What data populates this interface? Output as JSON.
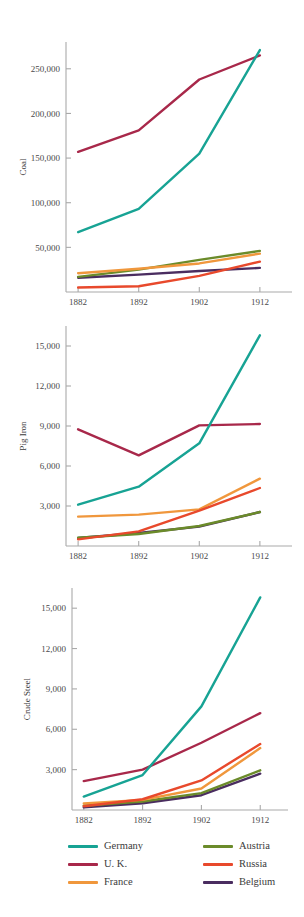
{
  "chart_data": [
    {
      "type": "line",
      "name": "coal-chart",
      "title": "",
      "ylabel": "Coal",
      "xlabel": "",
      "categories": [
        "1882",
        "1892",
        "1902",
        "1912"
      ],
      "x": [
        1882,
        1892,
        1902,
        1912
      ],
      "xlim": [
        1880,
        1914
      ],
      "ylim": [
        0,
        280000
      ],
      "yticks": [
        50000,
        100000,
        150000,
        200000,
        250000
      ],
      "ytick_labels": [
        "50,000",
        "100,000",
        "150,000",
        "200,000",
        "250,000"
      ],
      "grid": false,
      "series": [
        {
          "name": "Germany",
          "color": "#17a394",
          "values": [
            67000,
            93000,
            155000,
            271000
          ]
        },
        {
          "name": "U. K.",
          "color": "#a8284a",
          "values": [
            157000,
            181000,
            238000,
            265000
          ]
        },
        {
          "name": "France",
          "color": "#f0973c",
          "values": [
            21000,
            26000,
            32000,
            43000
          ]
        },
        {
          "name": "Austria",
          "color": "#6b8b2a",
          "values": [
            17000,
            25000,
            36000,
            46000
          ]
        },
        {
          "name": "Russia",
          "color": "#e8492c",
          "values": [
            5000,
            6500,
            18000,
            34000
          ]
        },
        {
          "name": "Belgium",
          "color": "#4a2d60",
          "values": [
            16000,
            19500,
            23500,
            27000
          ]
        }
      ]
    },
    {
      "type": "line",
      "name": "pig-iron-chart",
      "title": "",
      "ylabel": "Pig Iron",
      "xlabel": "",
      "categories": [
        "1882",
        "1892",
        "1902",
        "1912"
      ],
      "x": [
        1882,
        1892,
        1902,
        1912
      ],
      "xlim": [
        1880,
        1914
      ],
      "ylim": [
        0,
        16500
      ],
      "yticks": [
        3000,
        6000,
        9000,
        12000,
        15000
      ],
      "ytick_labels": [
        "3,000",
        "6,000",
        "9,000",
        "12,000",
        "15,000"
      ],
      "grid": false,
      "series": [
        {
          "name": "Germany",
          "color": "#17a394",
          "values": [
            3100,
            4450,
            7700,
            15800
          ]
        },
        {
          "name": "U. K.",
          "color": "#a8284a",
          "values": [
            8750,
            6800,
            9050,
            9150
          ]
        },
        {
          "name": "France",
          "color": "#f0973c",
          "values": [
            2200,
            2350,
            2750,
            5050
          ]
        },
        {
          "name": "Austria",
          "color": "#6b8b2a",
          "values": [
            620,
            900,
            1500,
            2550
          ]
        },
        {
          "name": "Russia",
          "color": "#e8492c",
          "values": [
            500,
            1100,
            2650,
            4350
          ]
        },
        {
          "name": "Belgium",
          "color": "#4a2d60",
          "values": [
            600,
            980,
            1450,
            2550
          ]
        }
      ]
    },
    {
      "type": "line",
      "name": "crude-steel-chart",
      "title": "",
      "ylabel": "Crude Steel",
      "xlabel": "",
      "categories": [
        "1882",
        "1892",
        "1902",
        "1912"
      ],
      "x": [
        1882,
        1892,
        1902,
        1912
      ],
      "xlim": [
        1880,
        1914
      ],
      "ylim": [
        0,
        16500
      ],
      "yticks": [
        3000,
        6000,
        9000,
        12000,
        15000
      ],
      "ytick_labels": [
        "3,000",
        "6,000",
        "9,000",
        "12,000",
        "15,000"
      ],
      "grid": false,
      "series": [
        {
          "name": "Germany",
          "color": "#17a394",
          "values": [
            1000,
            2600,
            7700,
            15800
          ]
        },
        {
          "name": "U. K.",
          "color": "#a8284a",
          "values": [
            2150,
            3000,
            5000,
            7200
          ]
        },
        {
          "name": "France",
          "color": "#f0973c",
          "values": [
            480,
            750,
            1600,
            4600
          ]
        },
        {
          "name": "Austria",
          "color": "#6b8b2a",
          "values": [
            320,
            630,
            1250,
            2950
          ]
        },
        {
          "name": "Russia",
          "color": "#e8492c",
          "values": [
            280,
            800,
            2200,
            4900
          ]
        },
        {
          "name": "Belgium",
          "color": "#4a2d60",
          "values": [
            200,
            500,
            1100,
            2700
          ]
        }
      ]
    }
  ],
  "legend": {
    "position": "bottom",
    "columns": [
      {
        "items": [
          {
            "label": "Germany",
            "color": "#17a394"
          },
          {
            "label": "U. K.",
            "color": "#a8284a"
          },
          {
            "label": "France",
            "color": "#f0973c"
          }
        ]
      },
      {
        "items": [
          {
            "label": "Austria",
            "color": "#6b8b2a"
          },
          {
            "label": "Russia",
            "color": "#e8492c"
          },
          {
            "label": "Belgium",
            "color": "#4a2d60"
          }
        ]
      }
    ]
  }
}
